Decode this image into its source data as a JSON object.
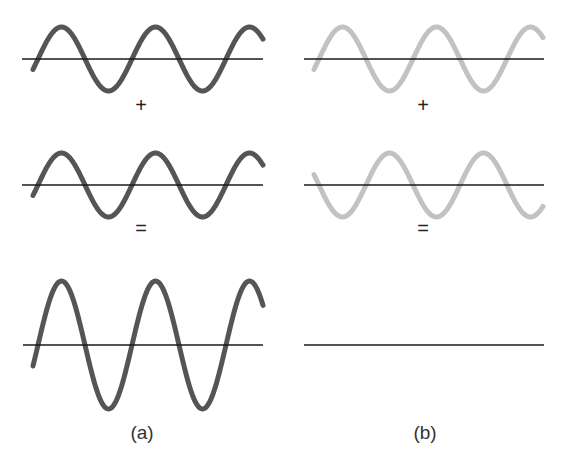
{
  "colors": {
    "background": "#ffffff",
    "wave_dark": "#555555",
    "wave_light": "#c2c2c2",
    "axis": "#1a1a1a",
    "text": "#222222"
  },
  "panels": [
    {
      "id": "a",
      "caption": "(a)",
      "caption_pos": [
        142,
        432
      ],
      "operators": [
        {
          "symbol": "+",
          "pos": [
            141,
            105
          ]
        },
        {
          "symbol": "=",
          "pos": [
            141,
            228
          ]
        }
      ],
      "waves": [
        {
          "name": "wave-1",
          "axis_y": 59,
          "axis_x": [
            22,
            263
          ],
          "x_start": 33,
          "x_end": 263,
          "zero_x": 38,
          "period": 94,
          "amplitude": 32,
          "phase_sign": 1,
          "color_key": "wave_dark"
        },
        {
          "name": "wave-2",
          "axis_y": 185,
          "axis_x": [
            22,
            263
          ],
          "x_start": 33,
          "x_end": 263,
          "zero_x": 38,
          "period": 94,
          "amplitude": 32,
          "phase_sign": 1,
          "color_key": "wave_dark"
        },
        {
          "name": "resultant",
          "axis_y": 345,
          "axis_x": [
            23,
            263
          ],
          "x_start": 33,
          "x_end": 263,
          "zero_x": 38,
          "period": 94,
          "amplitude": 64,
          "phase_sign": 1,
          "color_key": "wave_dark"
        }
      ]
    },
    {
      "id": "b",
      "caption": "(b)",
      "caption_pos": [
        425,
        432
      ],
      "operators": [
        {
          "symbol": "+",
          "pos": [
            423,
            105
          ]
        },
        {
          "symbol": "=",
          "pos": [
            423,
            228
          ]
        }
      ],
      "waves": [
        {
          "name": "wave-1",
          "axis_y": 59,
          "axis_x": [
            304,
            544
          ],
          "x_start": 314,
          "x_end": 543,
          "zero_x": 319,
          "period": 94,
          "amplitude": 32,
          "phase_sign": 1,
          "color_key": "wave_light"
        },
        {
          "name": "wave-2-inverted",
          "axis_y": 185,
          "axis_x": [
            304,
            544
          ],
          "x_start": 314,
          "x_end": 543,
          "zero_x": 319,
          "period": 94,
          "amplitude": 32,
          "phase_sign": -1,
          "color_key": "wave_light"
        },
        {
          "name": "resultant-flat",
          "axis_y": 345,
          "axis_x": [
            304,
            544
          ],
          "x_start": 304,
          "x_end": 544,
          "zero_x": 319,
          "period": 94,
          "amplitude": 0,
          "phase_sign": 1,
          "color_key": "axis"
        }
      ]
    }
  ]
}
